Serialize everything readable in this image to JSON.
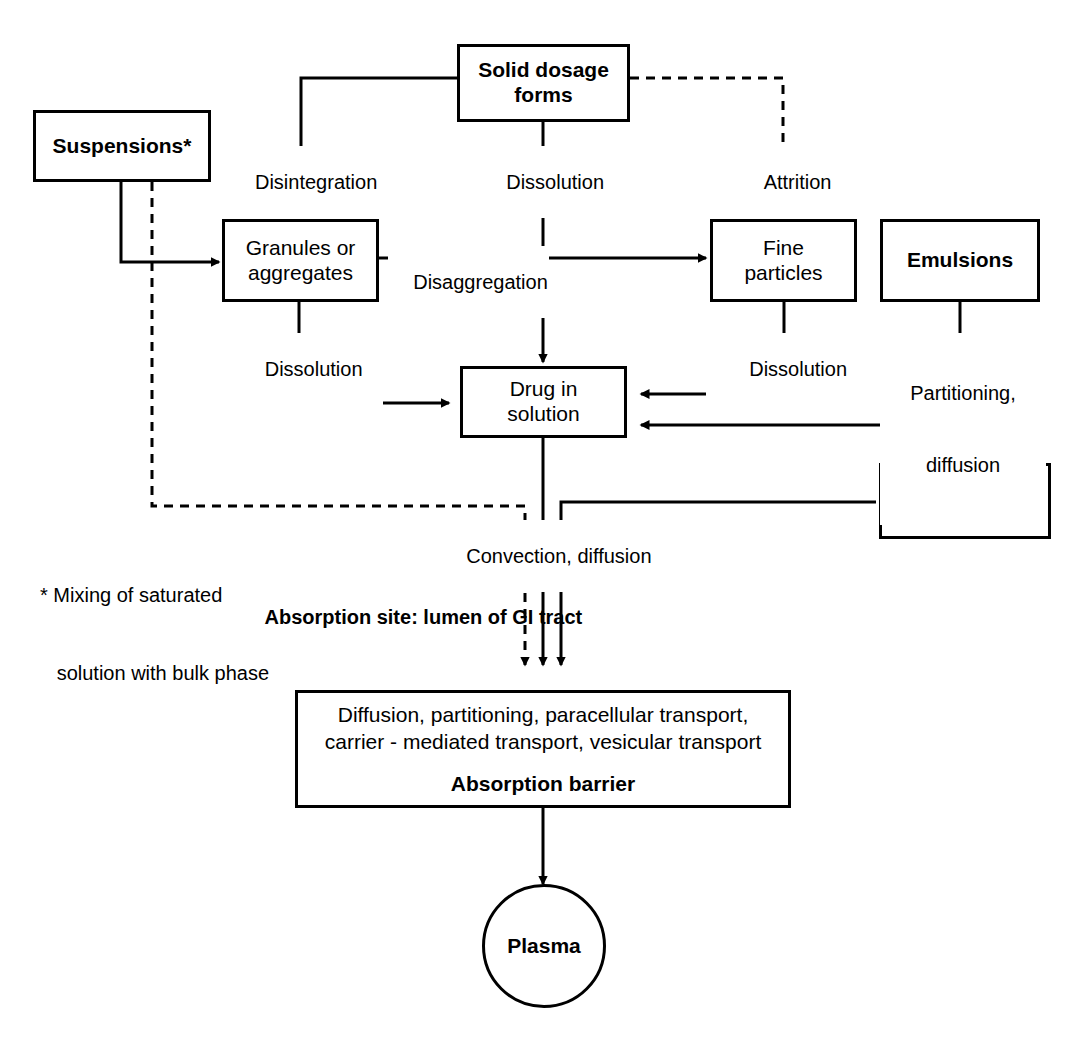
{
  "diagram": {
    "stroke_color": "#000000",
    "background_color": "#ffffff"
  },
  "nodes": {
    "solid_dosage_forms": {
      "line1": "Solid dosage",
      "line2": "forms",
      "bold": true
    },
    "suspensions": {
      "line1": "Suspensions*",
      "line2": "",
      "bold": true
    },
    "granules": {
      "line1": "Granules or",
      "line2": "aggregates",
      "bold": false
    },
    "fine_particles": {
      "line1": "Fine",
      "line2": "particles",
      "bold": false
    },
    "emulsions": {
      "line1": "Emulsions",
      "line2": "",
      "bold": true
    },
    "drug_in_solution": {
      "line1": "Drug in",
      "line2": "solution",
      "bold": false
    },
    "solution_dosage_forms": {
      "line1": "Solution",
      "line2": "dosage forms",
      "bold": true
    },
    "absorption_barrier": {
      "line1": "Diffusion, partitioning, paracellular transport,",
      "line2": "carrier - mediated transport, vesicular transport",
      "sub": "Absorption barrier"
    },
    "plasma": {
      "label": "Plasma"
    }
  },
  "edge_labels": {
    "disintegration": "Disintegration",
    "dissolution_top": "Dissolution",
    "attrition": "Attrition",
    "disaggregation": "Disaggregation",
    "dissolution_left": "Dissolution",
    "dissolution_right": "Dissolution",
    "partitioning_diffusion_l1": "Partitioning,",
    "partitioning_diffusion_l2": "diffusion",
    "convection_diffusion": "Convection, diffusion"
  },
  "annotations": {
    "footnote_line1": "* Mixing of saturated",
    "footnote_line2": "   solution with bulk phase",
    "absorption_site": "Absorption site: lumen of GI tract"
  }
}
